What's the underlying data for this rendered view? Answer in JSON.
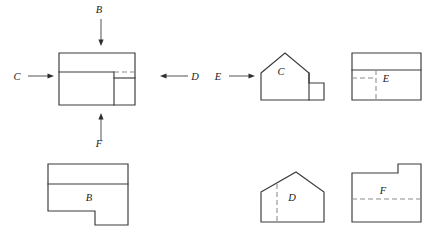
{
  "figure": {
    "background_color": "#ffffff",
    "solid_line_color": "#3a3a3a",
    "hidden_line_color": "#8c8c8c",
    "arrow_color": "#2e2e2e",
    "label_color": "#1a1a1a"
  },
  "direction_arrows": [
    {
      "id": "B",
      "label": "B",
      "direction": "down",
      "label_x": 99,
      "label_y": 13,
      "shaft_x1": 101,
      "shaft_y1": 19,
      "shaft_x2": 101,
      "shaft_y2": 40,
      "head_x": 101,
      "head_y": 46
    },
    {
      "id": "C",
      "label": "C",
      "direction": "right",
      "label_x": 17,
      "label_y": 80,
      "shaft_x1": 28,
      "shaft_y1": 76,
      "shaft_x2": 48,
      "shaft_y2": 76,
      "head_x": 54,
      "head_y": 76
    },
    {
      "id": "D",
      "label": "D",
      "direction": "left",
      "label_x": 195,
      "label_y": 80,
      "shaft_x1": 188,
      "shaft_y1": 76,
      "shaft_x2": 166,
      "shaft_y2": 76,
      "head_x": 160,
      "head_y": 76
    },
    {
      "id": "E",
      "label": "E",
      "direction": "right",
      "label_x": 218,
      "label_y": 80,
      "shaft_x1": 229,
      "shaft_y1": 76,
      "shaft_x2": 249,
      "shaft_y2": 76,
      "head_x": 255,
      "head_y": 76
    },
    {
      "id": "F",
      "label": "F",
      "direction": "up",
      "label_x": 99,
      "label_y": 147,
      "shaft_x1": 101,
      "shaft_y1": 141,
      "shaft_x2": 101,
      "shaft_y2": 119,
      "head_x": 101,
      "head_y": 113
    }
  ],
  "views": [
    {
      "id": "main",
      "name": "given-pictorial-front-view",
      "label": "",
      "label_x": 0,
      "label_y": 0,
      "solid_paths": [
        "M 59 53 L 135 53 L 135 105 L 59 105 Z",
        "M 59 72 L 114 72",
        "M 114 72 L 114 105",
        "M 114 78 L 135 78"
      ],
      "hidden_paths": [
        "M 114 72 L 135 72"
      ]
    },
    {
      "id": "C",
      "name": "view-c-candidate",
      "label": "C",
      "label_x": 281,
      "label_y": 75,
      "solid_paths": [
        "M 261 73 L 285 53 L 309 73 L 309 83 L 324 83 L 324 100 L 261 100 Z",
        "M 309 73 L 309 100"
      ],
      "hidden_paths": []
    },
    {
      "id": "E",
      "name": "view-e-candidate",
      "label": "E",
      "label_x": 386,
      "label_y": 82,
      "solid_paths": [
        "M 352 53 L 421 53 L 421 100 L 352 100 Z",
        "M 352 70 L 421 70"
      ],
      "hidden_paths": [
        "M 352 78 L 376 78",
        "M 376 70 L 376 100"
      ]
    },
    {
      "id": "B",
      "name": "view-b-candidate",
      "label": "B",
      "label_x": 89,
      "label_y": 201,
      "solid_paths": [
        "M 48 164 L 128 164 L 128 225 L 95 225 L 95 211 L 48 211 Z",
        "M 48 184 L 128 184"
      ],
      "hidden_paths": []
    },
    {
      "id": "D",
      "name": "view-d-candidate",
      "label": "D",
      "label_x": 292,
      "label_y": 201,
      "solid_paths": [
        "M 261 192 L 296 172 L 324 192 L 324 222 L 261 222 Z"
      ],
      "hidden_paths": [
        "M 277 184 L 277 222"
      ]
    },
    {
      "id": "F",
      "name": "view-f-candidate",
      "label": "F",
      "label_x": 383,
      "label_y": 194,
      "solid_paths": [
        "M 352 173 L 398 173 L 398 164 L 421 164 L 421 222 L 352 222 Z"
      ],
      "hidden_paths": [
        "M 352 199 L 421 199"
      ]
    }
  ]
}
